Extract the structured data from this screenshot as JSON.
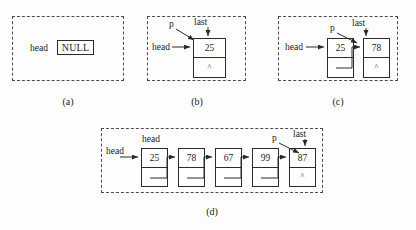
{
  "figure": {
    "background_color": "#fdfdfd",
    "line_color": "#2b2b2b",
    "dash_color": "#4a4a4a"
  },
  "null_symbol": "^",
  "panels": [
    {
      "id": "a",
      "caption": "(a)",
      "head_label": "head",
      "null_label": "NULL",
      "nodes": []
    },
    {
      "id": "b",
      "caption": "(b)",
      "head_label": "head",
      "p_label": "p",
      "last_label": "last",
      "nodes": [
        {
          "value": "25",
          "next": "^"
        }
      ]
    },
    {
      "id": "c",
      "caption": "(c)",
      "head_label": "head",
      "p_label": "p",
      "last_label": "last",
      "nodes": [
        {
          "value": "25",
          "next": "link"
        },
        {
          "value": "78",
          "next": "^"
        }
      ]
    },
    {
      "id": "d",
      "caption": "(d)",
      "head_label": "head",
      "head_label_top": "head",
      "p_label": "p",
      "last_label": "last",
      "nodes": [
        {
          "value": "25",
          "next": "link"
        },
        {
          "value": "78",
          "next": "link"
        },
        {
          "value": "67",
          "next": "link"
        },
        {
          "value": "99",
          "next": "link"
        },
        {
          "value": "87",
          "next": "^"
        }
      ]
    }
  ]
}
